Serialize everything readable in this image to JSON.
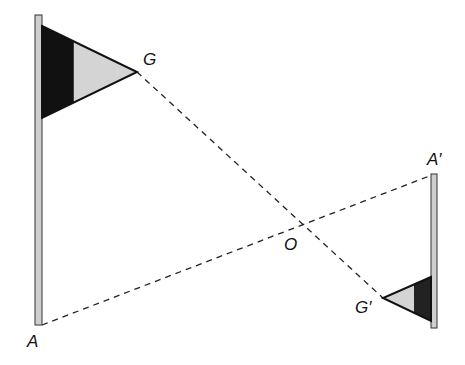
{
  "diagram": {
    "labels": {
      "G": "G",
      "A": "A",
      "A_prime": "A′",
      "G_prime": "G′",
      "O": "O"
    },
    "colors": {
      "pole_fill": "#cfcfcf",
      "flag_dark": "#111111",
      "flag_light": "#d4d4d4",
      "line": "#222222"
    }
  }
}
